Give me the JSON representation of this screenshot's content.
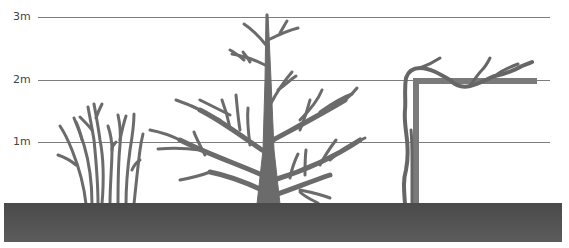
{
  "diagram": {
    "height_scale": {
      "labels": [
        {
          "text": "3m",
          "y": 17
        },
        {
          "text": "2m",
          "y": 80
        },
        {
          "text": "1m",
          "y": 142
        }
      ]
    },
    "plants": [
      {
        "name": "multi-stem shrub"
      },
      {
        "name": "branched tree"
      },
      {
        "name": "vine on trellis / pergola"
      }
    ],
    "colors": {
      "plant": "#6b6b6b",
      "trellis": "#7a7a7a",
      "ground": "#555555",
      "gridline": "#7d7d7d",
      "label": "#444444",
      "background": "#ffffff"
    }
  }
}
